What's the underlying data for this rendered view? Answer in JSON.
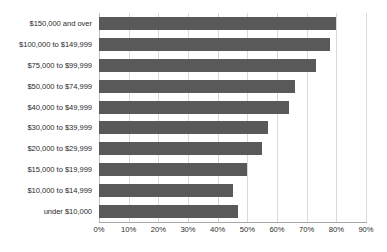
{
  "chart_data": {
    "type": "bar",
    "orientation": "horizontal",
    "title": "",
    "xlabel": "",
    "ylabel": "",
    "xlim": [
      0,
      90
    ],
    "grid": true,
    "legend": null,
    "bar_color": "#595959",
    "gridline_color": "#d9d9d9",
    "categories": [
      "$150,000 and over",
      "$100,000 to $149,999",
      "$75,000 to $99,999",
      "$50,000 to $74,999",
      "$40,000 to $49,999",
      "$30,000 to $39,999",
      "$20,000 to $29,999",
      "$15,000 to $19,999",
      "$10,000 to $14,999",
      "under $10,000"
    ],
    "values": [
      80,
      78,
      73,
      66,
      64,
      57,
      55,
      50,
      45,
      47
    ],
    "xticks": [
      0,
      10,
      20,
      30,
      40,
      50,
      60,
      70,
      80,
      90
    ],
    "xticklabels": [
      "0%",
      "10%",
      "20%",
      "30%",
      "40%",
      "50%",
      "60%",
      "70%",
      "80%",
      "90%"
    ]
  }
}
